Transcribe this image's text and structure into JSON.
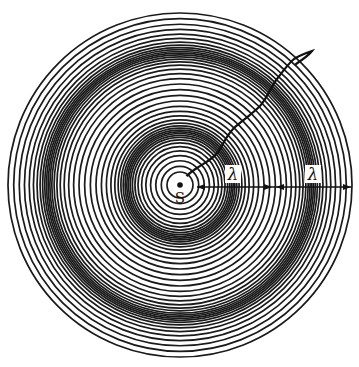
{
  "diagram": {
    "source_label": "S",
    "wavelength_labels": [
      "λ",
      "λ"
    ],
    "ring_count": 44,
    "wavelengths_shown": 2,
    "elements": [
      "concentric-wavefronts",
      "point-source",
      "wavy-ray",
      "wavelength-arrows"
    ],
    "colors": {
      "ink": "#111111",
      "background": "#ffffff"
    }
  }
}
